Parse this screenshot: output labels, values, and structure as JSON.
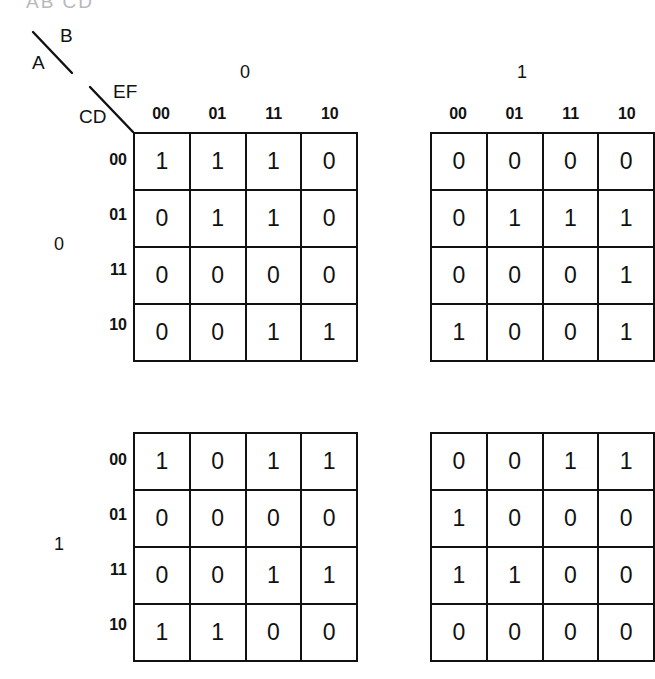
{
  "figure": {
    "top_artifact": "AB CD",
    "variables": {
      "row_outer": "A",
      "col_outer": "B",
      "row_inner": "CD",
      "col_inner": "EF"
    },
    "col_group_labels": [
      "0",
      "1"
    ],
    "row_group_labels": [
      "0",
      "1"
    ],
    "col_labels": [
      "00",
      "01",
      "11",
      "10"
    ],
    "row_labels": [
      "00",
      "01",
      "11",
      "10"
    ],
    "line_color": "#111111",
    "background_color": "#ffffff"
  },
  "chart_data": {
    "type": "table",
    "xlabel": "EF",
    "ylabel": "CD",
    "categories": [
      "00",
      "01",
      "11",
      "10"
    ],
    "row_categories": [
      "00",
      "01",
      "11",
      "10"
    ],
    "variables": [
      "A",
      "B",
      "C",
      "D",
      "E",
      "F"
    ],
    "grid": true,
    "legend": "none",
    "maps": [
      {
        "name": "map-A0-B0",
        "a": "0",
        "b": "0",
        "position": "top-left",
        "rows": [
          {
            "cd": "00",
            "values": [
              1,
              1,
              1,
              0
            ]
          },
          {
            "cd": "01",
            "values": [
              0,
              1,
              1,
              0
            ]
          },
          {
            "cd": "11",
            "values": [
              0,
              0,
              0,
              0
            ]
          },
          {
            "cd": "10",
            "values": [
              0,
              0,
              1,
              1
            ]
          }
        ]
      },
      {
        "name": "map-A0-B1",
        "a": "0",
        "b": "1",
        "position": "top-right",
        "rows": [
          {
            "cd": "00",
            "values": [
              0,
              0,
              0,
              0
            ]
          },
          {
            "cd": "01",
            "values": [
              0,
              1,
              1,
              1
            ]
          },
          {
            "cd": "11",
            "values": [
              0,
              0,
              0,
              1
            ]
          },
          {
            "cd": "10",
            "values": [
              1,
              0,
              0,
              1
            ]
          }
        ]
      },
      {
        "name": "map-A1-B0",
        "a": "1",
        "b": "0",
        "position": "bottom-left",
        "rows": [
          {
            "cd": "00",
            "values": [
              1,
              0,
              1,
              1
            ]
          },
          {
            "cd": "01",
            "values": [
              0,
              0,
              0,
              0
            ]
          },
          {
            "cd": "11",
            "values": [
              0,
              0,
              1,
              1
            ]
          },
          {
            "cd": "10",
            "values": [
              1,
              1,
              0,
              0
            ]
          }
        ]
      },
      {
        "name": "map-A1-B1",
        "a": "1",
        "b": "1",
        "position": "bottom-right",
        "rows": [
          {
            "cd": "00",
            "values": [
              0,
              0,
              1,
              1
            ]
          },
          {
            "cd": "01",
            "values": [
              1,
              0,
              0,
              0
            ]
          },
          {
            "cd": "11",
            "values": [
              1,
              1,
              0,
              0
            ]
          },
          {
            "cd": "10",
            "values": [
              0,
              0,
              0,
              0
            ]
          }
        ]
      }
    ]
  }
}
